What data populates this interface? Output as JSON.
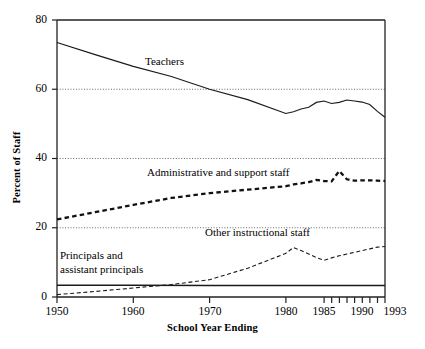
{
  "chart_data": {
    "type": "line",
    "title": "",
    "xlabel": "School Year Ending",
    "ylabel": "Percent of Staff",
    "xlim": [
      1950,
      1993
    ],
    "ylim": [
      0,
      80
    ],
    "grid": true,
    "grid_style": "dotted horizontal gridlines at 20, 40, 60",
    "legend_position": "inline annotations on plot",
    "yticks": [
      0,
      20,
      40,
      60,
      80
    ],
    "ytick_labels": [
      "0",
      "20",
      "40",
      "60",
      "80"
    ],
    "xticks": [
      1950,
      1960,
      1970,
      1980,
      1985,
      1986,
      1987,
      1988,
      1989,
      1990,
      1991,
      1992,
      1993
    ],
    "xtick_labels": [
      "1950",
      "1960",
      "1970",
      "1980",
      "1985",
      "1990",
      "1993"
    ],
    "xtick_labeled_values": [
      1950,
      1960,
      1970,
      1980,
      1985,
      1990,
      1993
    ],
    "series": [
      {
        "name": "Teachers",
        "label": "Teachers",
        "style": "solid",
        "x": [
          1950,
          1955,
          1960,
          1965,
          1970,
          1975,
          1980,
          1981,
          1982,
          1983,
          1984,
          1985,
          1986,
          1987,
          1988,
          1989,
          1990,
          1991,
          1992,
          1993
        ],
        "values": [
          73.5,
          70.0,
          66.6,
          63.7,
          60.0,
          57.0,
          53.0,
          53.5,
          54.3,
          54.8,
          56.2,
          56.6,
          55.9,
          56.2,
          56.9,
          56.6,
          56.3,
          55.6,
          53.6,
          51.9
        ]
      },
      {
        "name": "Administrative and support staff",
        "label": "Administrative and support staff",
        "style": "dashed-bold",
        "x": [
          1950,
          1955,
          1960,
          1965,
          1970,
          1975,
          1980,
          1981,
          1982,
          1983,
          1984,
          1985,
          1986,
          1987,
          1988,
          1989,
          1990,
          1991,
          1992,
          1993
        ],
        "values": [
          22.4,
          24.5,
          26.6,
          28.6,
          30.0,
          31.0,
          32.0,
          32.5,
          32.8,
          33.2,
          33.8,
          33.5,
          33.4,
          36.4,
          34.0,
          33.6,
          33.7,
          33.7,
          33.6,
          33.5
        ]
      },
      {
        "name": "Other instructional staff",
        "label": "Other instructional staff",
        "style": "dashed-thin",
        "x": [
          1950,
          1955,
          1960,
          1965,
          1970,
          1975,
          1980,
          1981,
          1982,
          1983,
          1984,
          1985,
          1986,
          1987,
          1988,
          1989,
          1990,
          1991,
          1992,
          1993
        ],
        "values": [
          0.7,
          1.6,
          2.6,
          3.6,
          5.0,
          8.3,
          12.6,
          14.3,
          13.4,
          12.4,
          11.4,
          10.6,
          11.3,
          11.9,
          12.4,
          12.9,
          13.4,
          13.9,
          14.4,
          14.6
        ]
      },
      {
        "name": "Principals and assistant principals",
        "label": "Principals and\nassistant principals",
        "label_line1": "Principals and",
        "label_line2": "assistant principals",
        "style": "solid-thin",
        "x": [
          1950,
          1960,
          1970,
          1980,
          1985,
          1990,
          1993
        ],
        "values": [
          3.4,
          3.4,
          3.3,
          3.3,
          3.3,
          3.3,
          3.3
        ]
      }
    ]
  },
  "annotations": {
    "teachers": "Teachers",
    "admin": "Administrative and support staff",
    "other": "Other instructional staff",
    "principals_line1": "Principals and",
    "principals_line2": "assistant principals"
  },
  "axes": {
    "x_title": "School Year Ending",
    "y_title": "Percent of Staff"
  },
  "colors": {
    "line": "#1a1a1a",
    "grid": "#555555",
    "axis": "#000000",
    "background": "#ffffff"
  }
}
